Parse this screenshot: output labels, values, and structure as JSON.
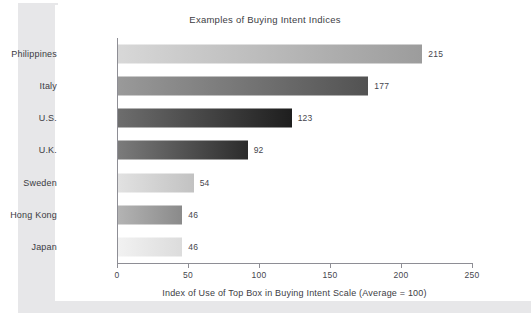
{
  "chart_data": {
    "type": "bar",
    "orientation": "horizontal",
    "title": "Examples of Buying Intent Indices",
    "xlabel": "Index of Use of Top Box in Buying Intent Scale (Average = 100)",
    "ylabel": "",
    "xlim": [
      0,
      250
    ],
    "xticks": [
      0,
      50,
      100,
      150,
      200,
      250
    ],
    "xtick_labels": [
      "0",
      "50",
      "100",
      "150",
      "200",
      "250"
    ],
    "grid": false,
    "legend": false,
    "categories": [
      "Philippines",
      "Italy",
      "U.S.",
      "U.K.",
      "Sweden",
      "Hong Kong",
      "Japan"
    ],
    "values": [
      215,
      177,
      123,
      92,
      54,
      46,
      46
    ],
    "value_labels": [
      "215",
      "177",
      "123",
      "92",
      "54",
      "46",
      "46"
    ],
    "bars": [
      {
        "category": "Philippines",
        "value": 215,
        "label": "215",
        "color_start": "#d8d8d8",
        "color_end": "#9c9c9c"
      },
      {
        "category": "Italy",
        "value": 177,
        "label": "177",
        "color_start": "#9a9a9a",
        "color_end": "#525252"
      },
      {
        "category": "U.S.",
        "value": 123,
        "label": "123",
        "color_start": "#6e6e6e",
        "color_end": "#1e1e1e"
      },
      {
        "category": "U.K.",
        "value": 92,
        "label": "92",
        "color_start": "#7c7c7c",
        "color_end": "#2b2b2b"
      },
      {
        "category": "Sweden",
        "value": 54,
        "label": "54",
        "color_start": "#e2e2e2",
        "color_end": "#c2c2c2"
      },
      {
        "category": "Hong Kong",
        "value": 46,
        "label": "46",
        "color_start": "#b4b4b4",
        "color_end": "#8a8a8a"
      },
      {
        "category": "Japan",
        "value": 46,
        "label": "46",
        "color_start": "#f2f2f2",
        "color_end": "#dcdcdc"
      }
    ]
  },
  "colors": {
    "panel_background": "#ffffff",
    "page_shadow": "#e7e7e9",
    "axis_line": "#8e8e95",
    "text": "#3d3d44"
  }
}
